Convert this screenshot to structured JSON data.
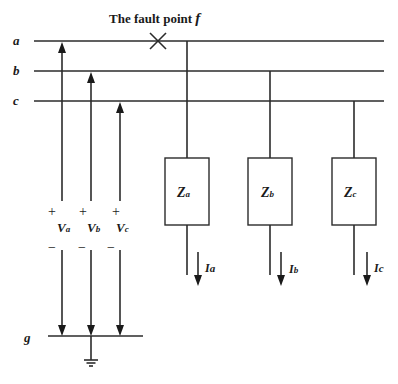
{
  "diagram": {
    "title_prefix": "The fault point ",
    "title_var": "f",
    "buses": [
      {
        "label": "a"
      },
      {
        "label": "b"
      },
      {
        "label": "c"
      }
    ],
    "ground_bus_label": "g",
    "sources": [
      {
        "main": "V",
        "sub": "a",
        "plus": "+",
        "minus": "−"
      },
      {
        "main": "V",
        "sub": "b",
        "plus": "+",
        "minus": "−"
      },
      {
        "main": "V",
        "sub": "c",
        "plus": "+",
        "minus": "−"
      }
    ],
    "loads": [
      {
        "main": "Z",
        "sub": "a",
        "bus": "a"
      },
      {
        "main": "Z",
        "sub": "b",
        "bus": "b"
      },
      {
        "main": "Z",
        "sub": "c",
        "bus": "c"
      }
    ],
    "currents": [
      {
        "main": "I",
        "sub": "a"
      },
      {
        "main": "I",
        "sub": "b"
      },
      {
        "main": "I",
        "sub": "c"
      }
    ],
    "fault_marker": "×",
    "colors": {
      "line": "#2b2b2b",
      "text": "#1a1a1a",
      "background": "#ffffff"
    }
  }
}
